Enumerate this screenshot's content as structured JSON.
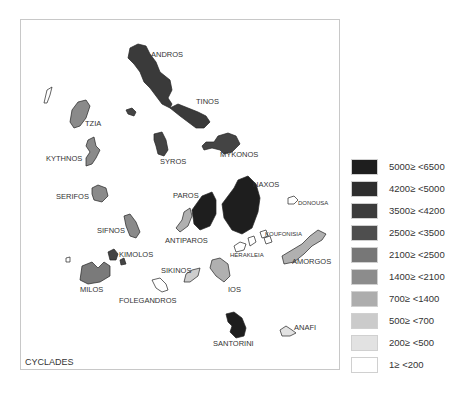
{
  "map": {
    "title": "CYCLADES",
    "islands": [
      {
        "name": "ANDROS",
        "class": "4200≥ <5000",
        "color": "#3a3a3a"
      },
      {
        "name": "TINOS",
        "class": "4200≥ <5000",
        "color": "#3a3a3a"
      },
      {
        "name": "TZIA",
        "class": "1400≥ <2100",
        "color": "#8a8a8a"
      },
      {
        "name": "KYTHNOS",
        "class": "1400≥ <2100",
        "color": "#8a8a8a"
      },
      {
        "name": "SYROS",
        "class": "3500≥ <4200",
        "color": "#444444"
      },
      {
        "name": "MYKONOS",
        "class": "3500≥ <4200",
        "color": "#444444"
      },
      {
        "name": "SERIFOS",
        "class": "1400≥ <2100",
        "color": "#8a8a8a"
      },
      {
        "name": "PAROS",
        "class": "5000≥ <6500",
        "color": "#1e1e1e"
      },
      {
        "name": "NAXOS",
        "class": "5000≥ <6500",
        "color": "#1e1e1e"
      },
      {
        "name": "DONOUSA",
        "class": "1≥ <200",
        "color": "#ffffff"
      },
      {
        "name": "ANTIPAROS",
        "class": "700≥ <1400",
        "color": "#b0b0b0"
      },
      {
        "name": "SIFNOS",
        "class": "1400≥ <2100",
        "color": "#8a8a8a"
      },
      {
        "name": "KOUFONISIA",
        "class": "1≥ <200",
        "color": "#ffffff"
      },
      {
        "name": "HERAKLEIA",
        "class": "1≥ <200",
        "color": "#ffffff"
      },
      {
        "name": "AMORGOS",
        "class": "700≥ <1400",
        "color": "#b0b0b0"
      },
      {
        "name": "KIMOLOS",
        "class": "3500≥ <4200",
        "color": "#444444"
      },
      {
        "name": "SIKINOS",
        "class": "500≥ <700",
        "color": "#cdcdcd"
      },
      {
        "name": "IOS",
        "class": "700≥ <1400",
        "color": "#b0b0b0"
      },
      {
        "name": "MILOS",
        "class": "2100≥ <2500",
        "color": "#7a7a7a"
      },
      {
        "name": "FOLEGANDROS",
        "class": "1≥ <200",
        "color": "#ffffff"
      },
      {
        "name": "SANTORINI",
        "class": "5000≥ <6500",
        "color": "#1e1e1e"
      },
      {
        "name": "ANAFI",
        "class": "200≥ <500",
        "color": "#e2e2e2"
      }
    ]
  },
  "legend": {
    "items": [
      {
        "label": "5000≥  <6500",
        "color": "#1e1e1e"
      },
      {
        "label": "4200≥  <5000",
        "color": "#2e2e2e"
      },
      {
        "label": "3500≥  <4200",
        "color": "#3c3c3c"
      },
      {
        "label": "2500≥  <3500",
        "color": "#4e4e4e"
      },
      {
        "label": "2100≥  <2500",
        "color": "#777777"
      },
      {
        "label": "1400≥  <2100",
        "color": "#8c8c8c"
      },
      {
        "label": "700≥  <1400",
        "color": "#adadad"
      },
      {
        "label": "500≥  <700",
        "color": "#cbcbcb"
      },
      {
        "label": "200≥  <500",
        "color": "#e2e2e2"
      },
      {
        "label": "1≥  <200",
        "color": "#ffffff"
      }
    ]
  }
}
